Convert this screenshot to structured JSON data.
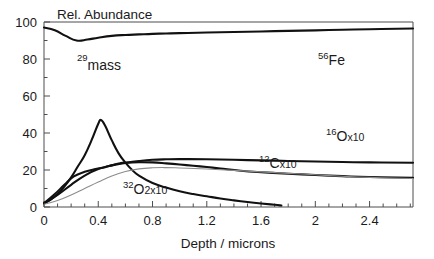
{
  "chart_data": {
    "type": "line",
    "title": "Rel. Abundance",
    "xlabel": "Depth / microns",
    "ylabel": "Rel. Abundance",
    "xlim": [
      0,
      2.72
    ],
    "ylim": [
      0,
      100
    ],
    "xticks": [
      "0",
      "0.4",
      "0.8",
      "1.2",
      "1.6",
      "2",
      "2.4"
    ],
    "xtick_values": [
      0,
      0.4,
      0.8,
      1.2,
      1.6,
      2,
      2.4
    ],
    "yticks": [
      "0",
      "20",
      "40",
      "60",
      "80",
      "100"
    ],
    "ytick_values": [
      0,
      20,
      40,
      60,
      80,
      100
    ],
    "minor_ticks": true,
    "grid": false,
    "legend_position": "inline-annotations",
    "series": [
      {
        "name": "56Fe",
        "label_isotope": "56",
        "label_element": "Fe",
        "label_multiplier": "",
        "style": "thick-dark",
        "x": [
          0.0,
          0.08,
          0.16,
          0.24,
          0.32,
          0.4,
          0.5,
          0.6,
          0.7,
          0.8,
          0.9,
          1.0,
          1.2,
          1.4,
          1.6,
          1.8,
          2.0,
          2.2,
          2.4,
          2.72
        ],
        "y": [
          97,
          95.5,
          92.5,
          90,
          90.5,
          91.5,
          92.5,
          93,
          93.3,
          93.6,
          93.8,
          94,
          94.3,
          94.6,
          94.9,
          95.2,
          95.5,
          95.8,
          96.1,
          96.5
        ]
      },
      {
        "name": "mass 29",
        "label_isotope": "29",
        "label_element": "mass",
        "label_multiplier": "",
        "style": "thick-dark",
        "x": [
          0.0,
          0.05,
          0.1,
          0.15,
          0.2,
          0.25,
          0.3,
          0.35,
          0.4,
          0.42,
          0.45,
          0.5,
          0.55,
          0.6,
          0.65,
          0.7,
          0.8,
          0.9,
          1.0,
          1.1,
          1.2,
          1.3,
          1.4,
          1.5,
          1.6,
          1.7,
          1.75
        ],
        "y": [
          2,
          4,
          7,
          11,
          16,
          22,
          28,
          36,
          45,
          47,
          44,
          36,
          29,
          24,
          20,
          17,
          13,
          10.5,
          8.5,
          7,
          5.8,
          4.6,
          3.6,
          2.7,
          1.9,
          1.2,
          0.8
        ]
      },
      {
        "name": "16O x10",
        "label_isotope": "16",
        "label_element": "O",
        "label_multiplier": "x10",
        "style": "thick-dark",
        "x": [
          0.0,
          0.1,
          0.2,
          0.3,
          0.4,
          0.5,
          0.6,
          0.7,
          0.8,
          0.9,
          1.0,
          1.2,
          1.4,
          1.6,
          1.8,
          2.0,
          2.2,
          2.4,
          2.72
        ],
        "y": [
          2,
          6.5,
          12,
          17,
          20.5,
          22.5,
          23.8,
          24.8,
          25.5,
          25.8,
          25.9,
          25.8,
          25.5,
          25.2,
          24.9,
          24.6,
          24.3,
          24.1,
          23.9
        ]
      },
      {
        "name": "12C x10",
        "label_isotope": "12",
        "label_element": "C",
        "label_multiplier": "x10",
        "style": "thick-dark",
        "x": [
          0.0,
          0.08,
          0.15,
          0.22,
          0.3,
          0.38,
          0.45,
          0.5,
          0.55,
          0.6,
          0.7,
          0.8,
          0.9,
          1.0,
          1.1,
          1.2,
          1.3,
          1.45,
          1.6,
          1.8,
          2.0,
          2.2,
          2.4,
          2.72
        ],
        "y": [
          2,
          7,
          12,
          16.5,
          19,
          20.5,
          21.5,
          22.5,
          23.5,
          24,
          24.2,
          24.1,
          23.6,
          23.0,
          22.3,
          21.6,
          20.8,
          19.6,
          18.8,
          18.0,
          17.3,
          16.7,
          16.2,
          15.8
        ]
      },
      {
        "name": "32O 2x10",
        "label_isotope": "32",
        "label_element": "O",
        "label_multiplier": "2x10",
        "style": "thin-gray",
        "x": [
          0.0,
          0.1,
          0.2,
          0.3,
          0.4,
          0.5,
          0.6,
          0.7,
          0.8,
          0.9,
          1.0,
          1.2,
          1.4,
          1.6,
          1.8,
          2.0,
          2.2,
          2.4,
          2.72
        ],
        "y": [
          1.5,
          3.5,
          6.5,
          10,
          13.5,
          16.8,
          19.2,
          20.6,
          21.2,
          21.3,
          21.1,
          20.5,
          19.8,
          19.0,
          18.2,
          17.4,
          16.6,
          16.0,
          15.4
        ]
      }
    ]
  },
  "labels": {
    "chart_title": "Rel. Abundance",
    "x_axis_title": "Depth / microns",
    "fe56_sup": "56",
    "fe56_text": "Fe",
    "mass29_sup": "29",
    "mass29_text": "mass",
    "o16_sup": "16",
    "o16_text": "O",
    "o16_mult": "x10",
    "c12_sup": "12",
    "c12_text": "C",
    "c12_mult": "x10",
    "o32_sup": "32",
    "o32_text": "O",
    "o32_mult": "2x10"
  }
}
